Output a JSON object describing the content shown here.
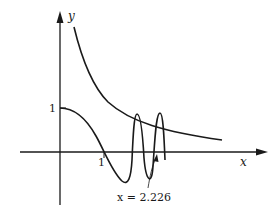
{
  "figure": {
    "type": "function-graph",
    "axes": {
      "x_label": "x",
      "y_label": "y",
      "x_tick_label": "1",
      "y_tick_label": "1"
    },
    "curves": [
      {
        "name": "decreasing-curve",
        "description": "monotonically decreasing curve approaching x-axis"
      },
      {
        "name": "oscillating-curve",
        "description": "starts at y=1, crosses x-axis near x=1, oscillates with growing frequency"
      }
    ],
    "annotation": {
      "text": "x = 2.226"
    },
    "colors": {
      "ink": "#1a1a1a",
      "background": "#ffffff"
    }
  }
}
